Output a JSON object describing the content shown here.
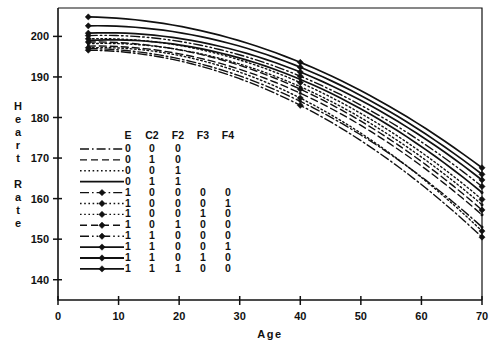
{
  "chart_data": {
    "type": "line",
    "title": "",
    "xlabel": "Age",
    "ylabel": "Heart Rate",
    "xlim": [
      0,
      70
    ],
    "ylim": [
      135,
      207
    ],
    "xticks": [
      0,
      10,
      20,
      30,
      40,
      50,
      60,
      70
    ],
    "yticks": [
      140,
      150,
      160,
      170,
      180,
      190,
      200
    ],
    "grid": false,
    "legend_position": "inside-lower-left",
    "marker_ages": [
      5,
      40,
      70
    ],
    "legend_columns": [
      "E",
      "C2",
      "F2",
      "F3",
      "F4"
    ],
    "series": [
      {
        "name": "series-1",
        "style": "dashdot",
        "marker": "none",
        "codes": {
          "E": "0",
          "C2": "0",
          "F2": "0",
          "F3": "",
          "F4": ""
        },
        "x": [
          5,
          40,
          70
        ],
        "y": [
          197.0,
          184.0,
          153.0
        ]
      },
      {
        "name": "series-2",
        "style": "dashed",
        "marker": "none",
        "codes": {
          "E": "0",
          "C2": "1",
          "F2": "0",
          "F3": "",
          "F4": ""
        },
        "x": [
          5,
          40,
          70
        ],
        "y": [
          197.6,
          186.0,
          156.0
        ]
      },
      {
        "name": "series-3",
        "style": "dotted",
        "marker": "none",
        "codes": {
          "E": "0",
          "C2": "0",
          "F2": "1",
          "F3": "",
          "F4": ""
        },
        "x": [
          5,
          40,
          70
        ],
        "y": [
          198.2,
          187.6,
          158.5
        ]
      },
      {
        "name": "series-4",
        "style": "solid",
        "marker": "none",
        "codes": {
          "E": "0",
          "C2": "1",
          "F2": "1",
          "F3": "",
          "F4": ""
        },
        "x": [
          5,
          40,
          70
        ],
        "y": [
          199.0,
          189.4,
          161.5
        ]
      },
      {
        "name": "series-5",
        "style": "dashdot",
        "marker": "diamond",
        "codes": {
          "E": "1",
          "C2": "0",
          "F2": "0",
          "F3": "0",
          "F4": "0"
        },
        "x": [
          5,
          40,
          70
        ],
        "y": [
          196.6,
          183.0,
          150.5
        ]
      },
      {
        "name": "series-6",
        "style": "dotted",
        "marker": "diamond",
        "codes": {
          "E": "1",
          "C2": "0",
          "F2": "0",
          "F3": "0",
          "F4": "1"
        },
        "x": [
          5,
          40,
          70
        ],
        "y": [
          197.2,
          184.8,
          152.0
        ]
      },
      {
        "name": "series-7",
        "style": "dotted",
        "marker": "diamond",
        "codes": {
          "E": "1",
          "C2": "0",
          "F2": "0",
          "F3": "1",
          "F4": "0"
        },
        "x": [
          5,
          40,
          70
        ],
        "y": [
          199.4,
          188.6,
          159.8
        ]
      },
      {
        "name": "series-8",
        "style": "dashed",
        "marker": "diamond",
        "codes": {
          "E": "1",
          "C2": "0",
          "F2": "1",
          "F3": "0",
          "F4": "0"
        },
        "x": [
          5,
          40,
          70
        ],
        "y": [
          198.6,
          187.0,
          157.2
        ]
      },
      {
        "name": "series-9",
        "style": "dashdotdot",
        "marker": "diamond",
        "codes": {
          "E": "1",
          "C2": "1",
          "F2": "0",
          "F3": "0",
          "F4": "0"
        },
        "x": [
          5,
          40,
          70
        ],
        "y": [
          200.2,
          190.2,
          163.0
        ]
      },
      {
        "name": "series-10",
        "style": "solid",
        "marker": "diamond",
        "codes": {
          "E": "1",
          "C2": "1",
          "F2": "0",
          "F3": "0",
          "F4": "1"
        },
        "x": [
          5,
          40,
          70
        ],
        "y": [
          202.6,
          192.4,
          166.0
        ]
      },
      {
        "name": "series-11",
        "style": "solid",
        "marker": "diamond",
        "codes": {
          "E": "1",
          "C2": "1",
          "F2": "0",
          "F3": "1",
          "F4": "0"
        },
        "x": [
          5,
          40,
          70
        ],
        "y": [
          204.8,
          193.6,
          167.6
        ]
      },
      {
        "name": "series-12",
        "style": "solid",
        "marker": "diamond",
        "codes": {
          "E": "1",
          "C2": "1",
          "F2": "1",
          "F3": "0",
          "F4": "0"
        },
        "x": [
          5,
          40,
          70
        ],
        "y": [
          200.8,
          191.2,
          164.6
        ]
      }
    ]
  },
  "axes": {
    "y_label_letters": [
      "H",
      "e",
      "a",
      "r",
      "t",
      " ",
      "R",
      "a",
      "t",
      "e"
    ],
    "x_label": "Age",
    "x_tick_labels": [
      "0",
      "10",
      "20",
      "30",
      "40",
      "50",
      "60",
      "70"
    ],
    "y_tick_labels": [
      "140",
      "150",
      "160",
      "170",
      "180",
      "190",
      "200"
    ]
  },
  "legend": {
    "headers": [
      "E",
      "C2",
      "F2",
      "F3",
      "F4"
    ],
    "rows": [
      {
        "style": "dashdot",
        "marker": "none",
        "values": [
          "0",
          "0",
          "0",
          "",
          ""
        ]
      },
      {
        "style": "dashed",
        "marker": "none",
        "values": [
          "0",
          "1",
          "0",
          "",
          ""
        ]
      },
      {
        "style": "dotted",
        "marker": "none",
        "values": [
          "0",
          "0",
          "1",
          "",
          ""
        ]
      },
      {
        "style": "solid",
        "marker": "none",
        "values": [
          "0",
          "1",
          "1",
          "",
          ""
        ]
      },
      {
        "style": "dashdot",
        "marker": "diamond",
        "values": [
          "1",
          "0",
          "0",
          "0",
          "0"
        ]
      },
      {
        "style": "dotted",
        "marker": "diamond",
        "values": [
          "1",
          "0",
          "0",
          "0",
          "1"
        ]
      },
      {
        "style": "dotted",
        "marker": "diamond",
        "values": [
          "1",
          "0",
          "0",
          "1",
          "0"
        ]
      },
      {
        "style": "dashed",
        "marker": "diamond",
        "values": [
          "1",
          "0",
          "1",
          "0",
          "0"
        ]
      },
      {
        "style": "dashdotdot",
        "marker": "diamond",
        "values": [
          "1",
          "1",
          "0",
          "0",
          "0"
        ]
      },
      {
        "style": "solid",
        "marker": "diamond",
        "values": [
          "1",
          "1",
          "0",
          "0",
          "1"
        ]
      },
      {
        "style": "solid",
        "marker": "diamond",
        "values": [
          "1",
          "1",
          "0",
          "1",
          "0"
        ]
      },
      {
        "style": "solid",
        "marker": "diamond",
        "values": [
          "1",
          "1",
          "1",
          "0",
          "0"
        ]
      }
    ]
  },
  "colors": {
    "ink": "#111111",
    "background": "#ffffff"
  }
}
